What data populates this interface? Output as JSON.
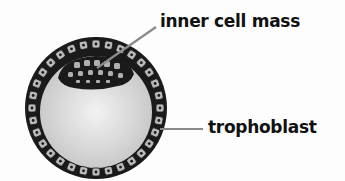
{
  "diagram": {
    "labels": [
      {
        "id": "inner_cell_mass",
        "text": "inner cell mass"
      },
      {
        "id": "trophoblast",
        "text": "trophoblast"
      }
    ]
  },
  "colors": {
    "background": "#fdfdfd",
    "ring_dark": "#1a1a1a",
    "cell_fill": "#b9b9b9",
    "cavity_center": "#f0f0f0",
    "cavity_edge": "#c8c8c8",
    "leader_line": "#8a8a8a",
    "text": "#111111"
  }
}
